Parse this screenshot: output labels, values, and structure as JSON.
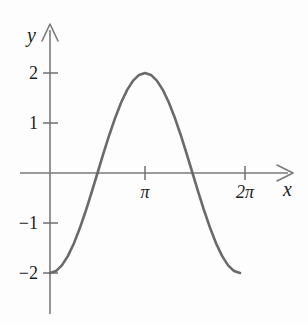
{
  "figure": {
    "background_color": "#fdfdfd",
    "width": 308,
    "height": 325
  },
  "axes": {
    "x_axis": {
      "label": "x",
      "color": "#777777",
      "arrow": true,
      "tick_labels": [
        "π",
        "2π"
      ],
      "tick_values": [
        3.14159,
        6.28319
      ]
    },
    "y_axis": {
      "label": "y",
      "color": "#777777",
      "arrow": true,
      "tick_labels": [
        "2",
        "1",
        "−1",
        "−2"
      ],
      "tick_values": [
        2,
        1,
        -1,
        -2
      ]
    }
  },
  "curve": {
    "color": "#6a6a6a",
    "stroke_width": 2.6,
    "expression": "y = -2 cos(x)"
  },
  "chart_data": {
    "type": "line",
    "title": "",
    "xlabel": "x",
    "ylabel": "y",
    "xlim": [
      0,
      6.28319
    ],
    "ylim": [
      -2,
      2
    ],
    "grid": false,
    "legend": null,
    "x_tick_labels": [
      "π",
      "2π"
    ],
    "x_ticks": [
      3.14159,
      6.28319
    ],
    "y_tick_labels": [
      "2",
      "1",
      "−1",
      "−2"
    ],
    "y_ticks": [
      2,
      1,
      -1,
      -2
    ],
    "annotations": [],
    "series": [
      {
        "name": "y = -2cos(x)",
        "color": "#6a6a6a",
        "x": [
          0.0,
          0.19635,
          0.3927,
          0.58905,
          0.7854,
          0.98175,
          1.1781,
          1.37445,
          1.5708,
          1.76715,
          1.9635,
          2.15984,
          2.35619,
          2.55254,
          2.74889,
          2.94524,
          3.14159,
          3.33794,
          3.53429,
          3.73064,
          3.92699,
          4.12334,
          4.31969,
          4.51604,
          4.71239,
          4.90874,
          5.10509,
          5.30144,
          5.49779,
          5.69414,
          5.89049,
          6.08684,
          6.28319
        ],
        "y": [
          -2.0,
          -1.96157,
          -1.84776,
          -1.66294,
          -1.41421,
          -1.11114,
          -0.76537,
          -0.39018,
          0.0,
          0.39018,
          0.76537,
          1.11114,
          1.41421,
          1.66294,
          1.84776,
          1.96157,
          2.0,
          1.96157,
          1.84776,
          1.66294,
          1.41421,
          1.11114,
          0.76537,
          0.39018,
          0.0,
          -0.39018,
          -0.76537,
          -1.11114,
          -1.41421,
          -1.66294,
          -1.84776,
          -1.96157,
          -2.0
        ]
      }
    ]
  }
}
